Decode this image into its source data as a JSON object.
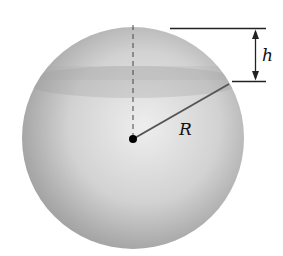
{
  "figure": {
    "labels": {
      "radius": "R",
      "height": "h"
    },
    "colors": {
      "sphere_light": "#e4e4e4",
      "sphere_dark": "#8c8c8c",
      "line": "#222222"
    }
  }
}
